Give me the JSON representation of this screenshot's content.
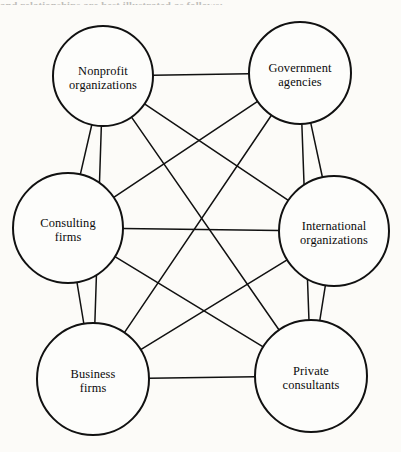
{
  "figure": {
    "page_text_remnant": "and relationships are best illustrated as follows:",
    "background_color": "#fcfbf8",
    "line_color": "#111111",
    "node_fill": "#fdfdfb"
  },
  "nodes": [
    {
      "id": "nonprofit-organizations",
      "label_line1": "Nonprofit",
      "label_line2": "organizations",
      "cx": 103,
      "cy": 76,
      "r": 50
    },
    {
      "id": "government-agencies",
      "label_line1": "Government",
      "label_line2": "agencies",
      "cx": 300,
      "cy": 73,
      "r": 51
    },
    {
      "id": "consulting-firms",
      "label_line1": "Consulting",
      "label_line2": "firms",
      "cx": 68,
      "cy": 228,
      "r": 55
    },
    {
      "id": "international-organizations",
      "label_line1": "International",
      "label_line2": "organizations",
      "cx": 334,
      "cy": 231,
      "r": 55
    },
    {
      "id": "business-firms",
      "label_line1": "Business",
      "label_line2": "firms",
      "cx": 93,
      "cy": 379,
      "r": 56
    },
    {
      "id": "private-consultants",
      "label_line1": "Private",
      "label_line2": "consultants",
      "cx": 311,
      "cy": 376,
      "r": 56
    }
  ],
  "edges": [
    {
      "from": "nonprofit-organizations",
      "to": "government-agencies"
    },
    {
      "from": "nonprofit-organizations",
      "to": "consulting-firms"
    },
    {
      "from": "nonprofit-organizations",
      "to": "international-organizations"
    },
    {
      "from": "nonprofit-organizations",
      "to": "business-firms"
    },
    {
      "from": "nonprofit-organizations",
      "to": "private-consultants"
    },
    {
      "from": "government-agencies",
      "to": "consulting-firms"
    },
    {
      "from": "government-agencies",
      "to": "international-organizations"
    },
    {
      "from": "government-agencies",
      "to": "business-firms"
    },
    {
      "from": "government-agencies",
      "to": "private-consultants"
    },
    {
      "from": "consulting-firms",
      "to": "international-organizations"
    },
    {
      "from": "consulting-firms",
      "to": "business-firms"
    },
    {
      "from": "consulting-firms",
      "to": "private-consultants"
    },
    {
      "from": "international-organizations",
      "to": "business-firms"
    },
    {
      "from": "international-organizations",
      "to": "private-consultants"
    },
    {
      "from": "business-firms",
      "to": "private-consultants"
    }
  ]
}
